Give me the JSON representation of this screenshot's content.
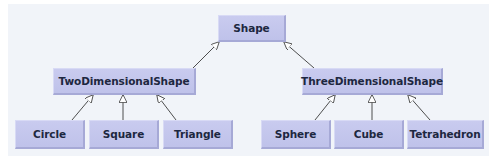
{
  "diagram": {
    "type": "class-hierarchy",
    "colors": {
      "background": "#f1f4f9",
      "node_fill": "#c5c8ec",
      "node_text": "#1d2740",
      "edge": "#3a3a3a"
    },
    "nodes": {
      "shape": "Shape",
      "two_dimensional_shape": "TwoDimensionalShape",
      "three_dimensional_shape": "ThreeDimensionalShape",
      "circle": "Circle",
      "square": "Square",
      "triangle": "Triangle",
      "sphere": "Sphere",
      "cube": "Cube",
      "tetrahedron": "Tetrahedron"
    },
    "edges": [
      {
        "from": "TwoDimensionalShape",
        "to": "Shape",
        "kind": "inheritance"
      },
      {
        "from": "ThreeDimensionalShape",
        "to": "Shape",
        "kind": "inheritance"
      },
      {
        "from": "Circle",
        "to": "TwoDimensionalShape",
        "kind": "inheritance"
      },
      {
        "from": "Square",
        "to": "TwoDimensionalShape",
        "kind": "inheritance"
      },
      {
        "from": "Triangle",
        "to": "TwoDimensionalShape",
        "kind": "inheritance"
      },
      {
        "from": "Sphere",
        "to": "ThreeDimensionalShape",
        "kind": "inheritance"
      },
      {
        "from": "Cube",
        "to": "ThreeDimensionalShape",
        "kind": "inheritance"
      },
      {
        "from": "Tetrahedron",
        "to": "ThreeDimensionalShape",
        "kind": "inheritance"
      }
    ]
  }
}
